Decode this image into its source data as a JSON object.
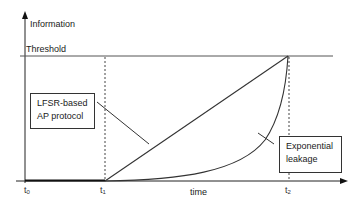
{
  "diagram": {
    "y_axis_label": "Information",
    "x_axis_label": "time",
    "threshold_label": "Threshold",
    "ticks": [
      {
        "base": "t",
        "sub": "0"
      },
      {
        "base": "t",
        "sub": "1"
      },
      {
        "base": "t",
        "sub": "2"
      }
    ],
    "curves": [
      {
        "name": "LFSR-based AP protocol",
        "shape": "linear",
        "from": "t1",
        "to": "t2 at threshold"
      },
      {
        "name": "Exponential leakage",
        "shape": "exponential",
        "from": "t1",
        "to": "t2 at threshold"
      }
    ],
    "callouts": {
      "lfsr": {
        "line1": "LFSR-based",
        "line2": "AP protocol"
      },
      "exponential": {
        "line1": "Exponential",
        "line2": "leakage"
      }
    },
    "colors": {
      "line": "#333333",
      "background": "#ffffff"
    }
  }
}
